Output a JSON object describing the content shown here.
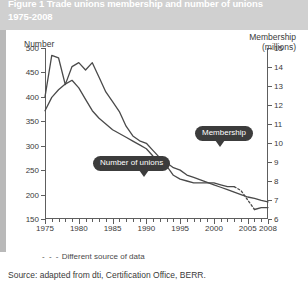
{
  "figure": {
    "title": "Figure 1 Trade unions membership and number of unions\n1975-2008",
    "source_note": "Source: adapted from dti, Certification Office, BERR.",
    "legend_note_symbol": "- - -",
    "legend_note_text": "Different source of data",
    "colors": {
      "title_band": "#d0d0d0",
      "title_text": "#ffffff",
      "card": "#ffffff",
      "axis": "#5e5e5e",
      "series": "#4a4a4a",
      "callout": "#3c3c3c"
    }
  },
  "chart_data": {
    "type": "line",
    "title": "Figure 1 Trade unions membership and number of unions 1975-2008",
    "xlabel": "",
    "ylabel": "Number",
    "y2label": "Membership (millions)",
    "grid": false,
    "legend": "callout labels on series",
    "xlim": [
      1975,
      2008
    ],
    "ylim": [
      150,
      500
    ],
    "y2lim": [
      6,
      15
    ],
    "x_ticks": [
      1975,
      1980,
      1985,
      1990,
      1995,
      2000,
      2005,
      2008
    ],
    "x_minor_tick_step": 1,
    "y_ticks": [
      150,
      200,
      250,
      300,
      350,
      400,
      450,
      500
    ],
    "y2_ticks": [
      6,
      7,
      8,
      9,
      10,
      11,
      12,
      13,
      14,
      15
    ],
    "series": [
      {
        "name": "Number of unions",
        "axis": "left",
        "style": "solid",
        "label_type": "callout",
        "x": [
          1975,
          1976,
          1977,
          1978,
          1979,
          1980,
          1981,
          1982,
          1983,
          1984,
          1985,
          1986,
          1987,
          1988,
          1989,
          1990,
          1991,
          1992,
          1993,
          1994,
          1995,
          1996,
          1997,
          1998,
          1999,
          2000,
          2001,
          2002,
          2003,
          2004,
          2005,
          2006,
          2007,
          2008
        ],
        "values": [
          400,
          485,
          480,
          425,
          462,
          470,
          455,
          470,
          440,
          410,
          390,
          370,
          340,
          320,
          310,
          305,
          290,
          275,
          265,
          255,
          250,
          240,
          235,
          230,
          225,
          220,
          215,
          210,
          205,
          200,
          195,
          192,
          188,
          185
        ]
      },
      {
        "name": "Membership",
        "axis": "right",
        "style": "solid-with-dashed-break",
        "dashed_segment": [
          2003,
          2006
        ],
        "label_type": "callout",
        "x": [
          1975,
          1976,
          1977,
          1978,
          1979,
          1980,
          1981,
          1982,
          1983,
          1984,
          1985,
          1986,
          1987,
          1988,
          1989,
          1990,
          1991,
          1992,
          1993,
          1994,
          1995,
          1996,
          1997,
          1998,
          1999,
          2000,
          2001,
          2002,
          2003,
          2004,
          2005,
          2006,
          2007,
          2008
        ],
        "values": [
          11.7,
          12.4,
          12.8,
          13.1,
          13.3,
          12.9,
          12.3,
          11.7,
          11.3,
          11.0,
          10.7,
          10.5,
          10.3,
          10.1,
          9.9,
          9.7,
          9.3,
          9.0,
          8.8,
          8.3,
          8.1,
          8.0,
          7.9,
          7.9,
          7.9,
          7.9,
          7.8,
          7.7,
          7.7,
          7.5,
          7.0,
          6.5,
          6.6,
          6.6
        ]
      }
    ]
  },
  "axes": {
    "left_title": "Number",
    "right_title_line1": "Membership",
    "right_title_line2": "(millions)"
  },
  "callouts": {
    "unions": "Number of unions",
    "membership": "Membership"
  }
}
